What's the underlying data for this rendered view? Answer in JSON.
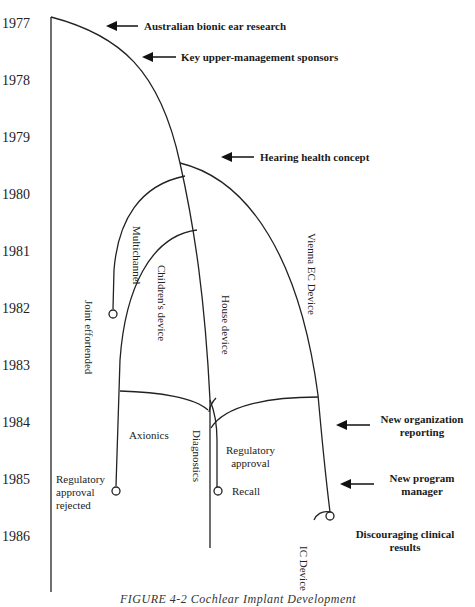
{
  "figure": {
    "caption": "FIGURE 4-2   Cochlear Implant Development",
    "years": [
      "1977",
      "1978",
      "1979",
      "1980",
      "1981",
      "1982",
      "1983",
      "1984",
      "1985",
      "1986"
    ],
    "annotations": {
      "australian": "Australian bionic ear research",
      "sponsors": "Key upper-management sponsors",
      "hearing": "Hearing health concept",
      "new_org_line1": "New organization",
      "new_org_line2": "reporting",
      "new_pm_line1": "New program",
      "new_pm_line2": "manager",
      "discouraging_line1": "Discouraging clinical",
      "discouraging_line2": "results"
    },
    "branches": {
      "multichannel": "Multichannel",
      "joint_effort_line1": "Joint effort",
      "joint_effort_line2": "ended",
      "childrens": "Children's device",
      "house": "House device",
      "vienna": "Vienna EC Device",
      "axionics": "Axionics",
      "diagnostics": "Diagnostics",
      "reg_approval_line1": "Regulatory",
      "reg_approval_line2": "approval",
      "recall": "Recall",
      "reg_rejected_line1": "Regulatory",
      "reg_rejected_line2": "approval",
      "reg_rejected_line3": "rejected",
      "ic_device": "IC Device"
    },
    "colors": {
      "line": "#222222",
      "text": "#1a1a1a",
      "background": "#ffffff"
    }
  }
}
